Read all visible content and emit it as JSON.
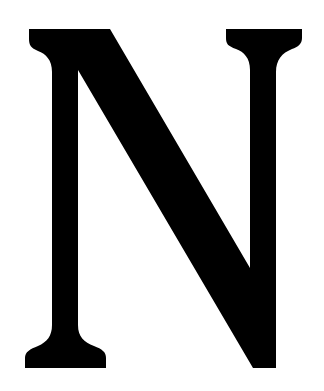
{
  "letter": {
    "character": "N",
    "fill_color": "#000000",
    "background_color": "#ffffff"
  }
}
